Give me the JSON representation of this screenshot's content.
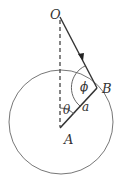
{
  "diagram": {
    "type": "geometry",
    "labels": {
      "O": "O",
      "B": "B",
      "A": "A",
      "a": "a",
      "theta": "θ",
      "phi": "ϕ"
    },
    "colors": {
      "line": "#333333",
      "circle": "#666666",
      "dashed": "#444444",
      "background": "#ffffff"
    },
    "points": {
      "O": [
        60,
        16
      ],
      "A": [
        61,
        128
      ],
      "B": [
        97,
        88
      ],
      "circle_center": [
        61,
        122
      ],
      "circle_radius": 52
    }
  }
}
